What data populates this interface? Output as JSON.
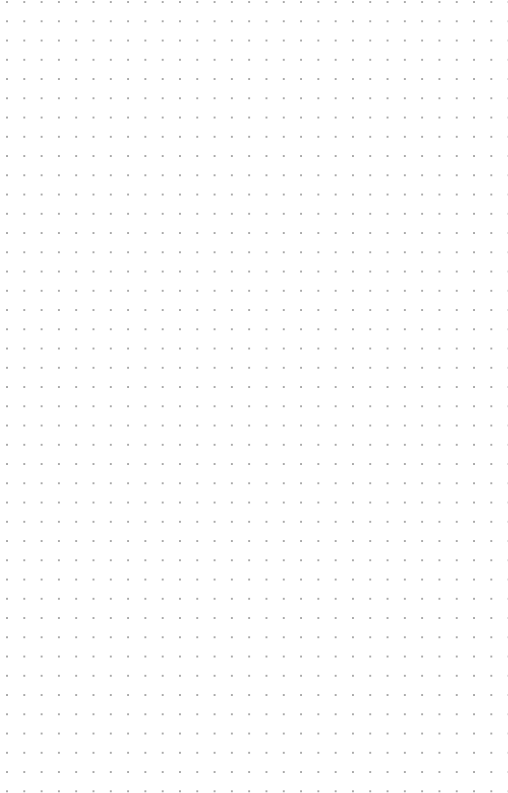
{
  "page": {
    "type": "dot-grid-paper",
    "background_color": "#ffffff",
    "dot_color": "#a8a8a8",
    "columns": 29,
    "rows": 40
  }
}
